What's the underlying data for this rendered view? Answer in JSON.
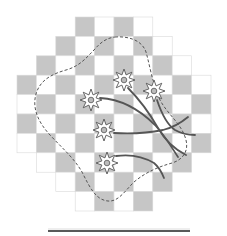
{
  "diagram": {
    "type": "checkerboard-with-flowers",
    "grid": {
      "origin": [
        17,
        17
      ],
      "cell_size": 19.4,
      "rows": 10,
      "cols": 10,
      "row_spans": [
        [
          3,
          6
        ],
        [
          2,
          7
        ],
        [
          1,
          8
        ],
        [
          0,
          9
        ],
        [
          0,
          9
        ],
        [
          0,
          9
        ],
        [
          0,
          9
        ],
        [
          1,
          8
        ],
        [
          2,
          7
        ],
        [
          3,
          6
        ]
      ],
      "dark_color": "#c6c6c6",
      "light_color": "#ffffff",
      "line_color": "#d9d9d9"
    },
    "outline": {
      "style": "dashed",
      "color": "#555555"
    },
    "flowers": [
      {
        "cx": 124,
        "cy": 80
      },
      {
        "cx": 154,
        "cy": 91
      },
      {
        "cx": 91,
        "cy": 100
      },
      {
        "cx": 104,
        "cy": 130
      },
      {
        "cx": 107,
        "cy": 163
      }
    ],
    "stem_color": "#555555",
    "petal_color": "#ffffff",
    "petal_outline": "#555555",
    "baseline": {
      "x1": 48,
      "x2": 190,
      "y": 231,
      "color": "#222222"
    }
  }
}
